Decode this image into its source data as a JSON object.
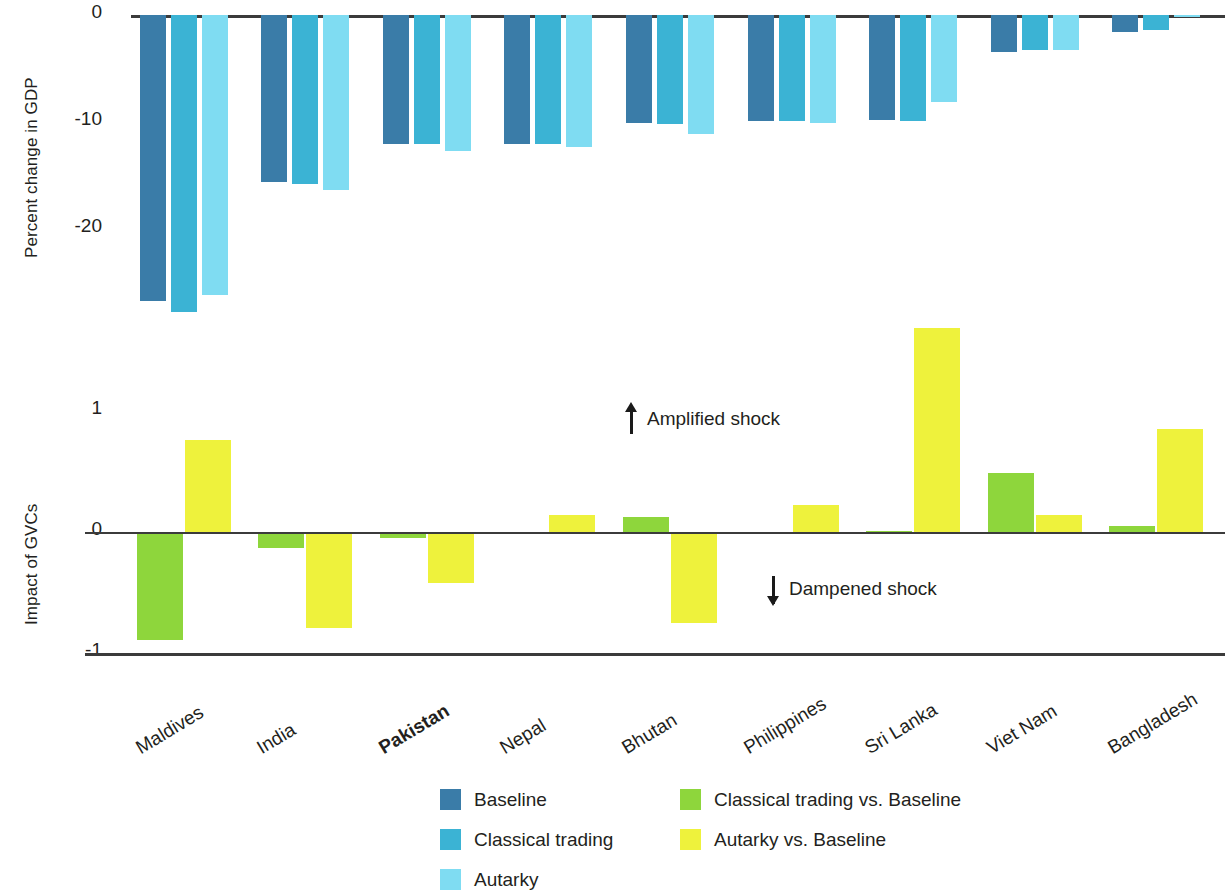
{
  "chart_data": {
    "type": "bar",
    "title": "",
    "panels": [
      {
        "id": "top",
        "ylabel": "Percent change in GDP",
        "yticks": [
          "0",
          "-10",
          "-20"
        ],
        "ytick_values": [
          0,
          -10,
          -20
        ],
        "ylim": [
          -30,
          0
        ],
        "grid": false,
        "categories": [
          "Maldives",
          "India",
          "Pakistan",
          "Nepal",
          "Bhutan",
          "Philippines",
          "Sri Lanka",
          "Viet Nam",
          "Bangladesh"
        ],
        "series": [
          {
            "name": "Baseline",
            "color": "#3a7ca8",
            "values": [
              -26.8,
              -15.6,
              -12.1,
              -12.1,
              -10.1,
              -9.9,
              -9.8,
              -3.5,
              -1.6
            ]
          },
          {
            "name": "Classical trading",
            "color": "#3bb3d4",
            "values": [
              -27.8,
              -15.8,
              -12.1,
              -12.1,
              -10.2,
              -9.9,
              -9.9,
              -3.3,
              -1.4
            ]
          },
          {
            "name": "Autarky",
            "color": "#7fdcf2",
            "values": [
              -26.2,
              -16.4,
              -12.7,
              -12.4,
              -11.1,
              -10.1,
              -8.1,
              -3.3,
              -0.2
            ]
          }
        ]
      },
      {
        "id": "bottom",
        "ylabel": "Impact of GVCs",
        "yticks": [
          "1",
          "0",
          "-1"
        ],
        "ytick_values": [
          1,
          0,
          -1
        ],
        "ylim": [
          -1,
          1.8
        ],
        "grid": false,
        "categories": [
          "Maldives",
          "India",
          "Pakistan",
          "Nepal",
          "Bhutan",
          "Philippines",
          "Sri Lanka",
          "Viet Nam",
          "Bangladesh"
        ],
        "series": [
          {
            "name": "Classical trading vs. Baseline",
            "color": "#8ed63c",
            "values": [
              -0.89,
              -0.13,
              -0.05,
              0.0,
              0.12,
              0.0,
              0.01,
              0.49,
              0.05
            ]
          },
          {
            "name": "Autarky vs. Baseline",
            "color": "#eef23c",
            "values": [
              0.76,
              -0.79,
              -0.42,
              0.14,
              -0.75,
              0.22,
              1.69,
              0.14,
              0.85
            ]
          }
        ]
      }
    ],
    "annotations": [
      {
        "id": "amplified",
        "text": "Amplified shock",
        "icon": "arrow-up-icon"
      },
      {
        "id": "dampened",
        "text": "Dampened shock",
        "icon": "arrow-down-icon"
      }
    ],
    "highlight_category": "Pakistan",
    "legend": {
      "position": "bottom-center",
      "columns": [
        {
          "items": [
            {
              "label": "Baseline",
              "color": "#3a7ca8"
            },
            {
              "label": "Classical trading",
              "color": "#3bb3d4"
            },
            {
              "label": "Autarky",
              "color": "#7fdcf2"
            }
          ]
        },
        {
          "items": [
            {
              "label": "Classical trading vs. Baseline",
              "color": "#8ed63c"
            },
            {
              "label": "Autarky vs. Baseline",
              "color": "#eef23c"
            }
          ]
        }
      ]
    }
  }
}
